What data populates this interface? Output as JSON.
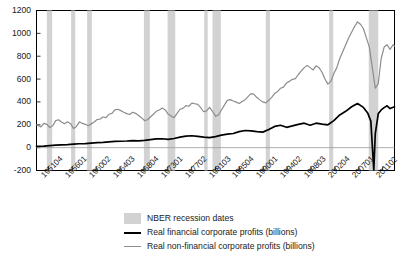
{
  "chart_data": {
    "type": "line",
    "title": "",
    "xlabel": "",
    "ylabel": "",
    "ylim": [
      -200,
      1200
    ],
    "ytick_labels": [
      "1200",
      "1000",
      "800",
      "600",
      "400",
      "200",
      "0",
      "-200"
    ],
    "ytick_values": [
      1200,
      1000,
      800,
      600,
      400,
      200,
      0,
      -200
    ],
    "grid": false,
    "legend_position": "below",
    "xtick_labels": [
      "1951Q4",
      "1956Q1",
      "1960Q2",
      "1964Q3",
      "1968Q4",
      "1973Q1",
      "1977Q2",
      "1981Q3",
      "1985Q4",
      "1990Q1",
      "1994Q2",
      "1998Q3",
      "2002Q4",
      "2007Q1",
      "2011Q2"
    ],
    "xtick_labels_raw": [
      "195104",
      "195601",
      "196002",
      "196403",
      "196804",
      "197301",
      "197702",
      "198103",
      "198504",
      "199001",
      "199402",
      "199803",
      "200204",
      "200701",
      "201102"
    ],
    "legend": [
      {
        "key": "recession",
        "label": "NBER recession dates",
        "style": "band",
        "color": "#d2d2d2"
      },
      {
        "key": "financial",
        "label": "Real financial corporate profits (billions)",
        "style": "line",
        "color": "#000000"
      },
      {
        "key": "nonfinancial",
        "label": "Real non-financial corporate profits (billions)",
        "style": "line",
        "color": "#8c8c8c"
      }
    ],
    "recession_bands": [
      {
        "start": 1953.5,
        "end": 1954.4
      },
      {
        "start": 1957.6,
        "end": 1958.3
      },
      {
        "start": 1960.3,
        "end": 1961.1
      },
      {
        "start": 1969.9,
        "end": 1970.9
      },
      {
        "start": 1973.9,
        "end": 1975.2
      },
      {
        "start": 1980.1,
        "end": 1980.5
      },
      {
        "start": 1981.5,
        "end": 1982.9
      },
      {
        "start": 1990.5,
        "end": 1991.2
      },
      {
        "start": 2001.2,
        "end": 2001.9
      },
      {
        "start": 2007.9,
        "end": 2009.5
      }
    ],
    "x_range": [
      1951.75,
      2012.25
    ],
    "series": [
      {
        "name": "Real financial corporate profits (billions)",
        "color": "#000000",
        "width": 1.7,
        "x": [
          1951.75,
          1953,
          1954,
          1955,
          1956,
          1957,
          1958,
          1959,
          1960,
          1961,
          1962,
          1963,
          1964,
          1965,
          1966,
          1967,
          1968,
          1969,
          1970,
          1971,
          1972,
          1973,
          1974,
          1975,
          1976,
          1977,
          1978,
          1979,
          1980,
          1981,
          1982,
          1983,
          1984,
          1985,
          1986,
          1987,
          1988,
          1989,
          1990,
          1991,
          1992,
          1993,
          1994,
          1995,
          1996,
          1997,
          1998,
          1999,
          2000,
          2001,
          2002,
          2003,
          2004,
          2005,
          2006,
          2007,
          2007.75,
          2008.25,
          2008.75,
          2009,
          2009.5,
          2010,
          2010.5,
          2011,
          2011.5,
          2012.25
        ],
        "y": [
          12,
          14,
          18,
          22,
          24,
          26,
          30,
          34,
          36,
          40,
          44,
          46,
          50,
          54,
          56,
          58,
          62,
          60,
          64,
          70,
          76,
          78,
          72,
          80,
          92,
          100,
          104,
          98,
          92,
          88,
          96,
          110,
          118,
          124,
          140,
          150,
          146,
          140,
          136,
          158,
          186,
          196,
          178,
          190,
          204,
          214,
          196,
          214,
          206,
          200,
          236,
          286,
          318,
          358,
          386,
          352,
          300,
          232,
          -196,
          120,
          296,
          330,
          350,
          366,
          342,
          358
        ],
        "y_comment": "quarterly real financial corporate profits, billions"
      },
      {
        "name": "Real non-financial corporate profits (billions)",
        "color": "#8c8c8c",
        "width": 1.2,
        "x": [
          1951.75,
          1952.5,
          1953,
          1953.5,
          1954,
          1954.5,
          1955,
          1955.5,
          1956,
          1956.5,
          1957,
          1957.5,
          1958,
          1958.5,
          1959,
          1959.5,
          1960,
          1960.5,
          1961,
          1961.5,
          1962,
          1962.5,
          1963,
          1963.5,
          1964,
          1964.5,
          1965,
          1965.5,
          1966,
          1966.5,
          1967,
          1967.5,
          1968,
          1968.5,
          1969,
          1969.5,
          1970,
          1970.5,
          1971,
          1971.5,
          1972,
          1972.5,
          1973,
          1973.5,
          1974,
          1974.5,
          1975,
          1975.5,
          1976,
          1976.5,
          1977,
          1977.5,
          1978,
          1978.5,
          1979,
          1979.5,
          1980,
          1980.5,
          1981,
          1981.5,
          1982,
          1982.5,
          1983,
          1983.5,
          1984,
          1984.5,
          1985,
          1985.5,
          1986,
          1986.5,
          1987,
          1987.5,
          1988,
          1988.5,
          1989,
          1989.5,
          1990,
          1990.5,
          1991,
          1991.5,
          1992,
          1992.5,
          1993,
          1993.5,
          1994,
          1994.5,
          1995,
          1995.5,
          1996,
          1996.5,
          1997,
          1997.5,
          1998,
          1998.5,
          1999,
          1999.5,
          2000,
          2000.5,
          2001,
          2001.5,
          2002,
          2002.5,
          2003,
          2003.5,
          2004,
          2004.5,
          2005,
          2005.5,
          2006,
          2006.5,
          2007,
          2007.5,
          2008,
          2008.5,
          2009,
          2009.5,
          2010,
          2010.5,
          2011,
          2011.5,
          2012,
          2012.25
        ],
        "y": [
          200,
          182,
          212,
          204,
          176,
          192,
          236,
          244,
          222,
          210,
          226,
          210,
          168,
          186,
          226,
          212,
          204,
          192,
          208,
          224,
          246,
          250,
          268,
          262,
          292,
          300,
          330,
          336,
          324,
          310,
          298,
          290,
          310,
          300,
          282,
          262,
          236,
          244,
          268,
          292,
          318,
          330,
          346,
          330,
          294,
          276,
          262,
          300,
          336,
          344,
          368,
          362,
          390,
          384,
          378,
          350,
          314,
          322,
          352,
          318,
          276,
          286,
          330,
          372,
          414,
          420,
          408,
          398,
          386,
          404,
          420,
          446,
          472,
          466,
          438,
          418,
          400,
          392,
          414,
          440,
          474,
          492,
          520,
          530,
          566,
          580,
          598,
          604,
          640,
          672,
          700,
          720,
          700,
          680,
          716,
          700,
          660,
          600,
          556,
          580,
          648,
          700,
          780,
          840,
          900,
          960,
          1010,
          1060,
          1100,
          1080,
          1040,
          960,
          880,
          700,
          520,
          560,
          780,
          880,
          900,
          860,
          900,
          890
        ],
        "y_comment": "quarterly real non-financial corporate profits, billions"
      }
    ]
  }
}
